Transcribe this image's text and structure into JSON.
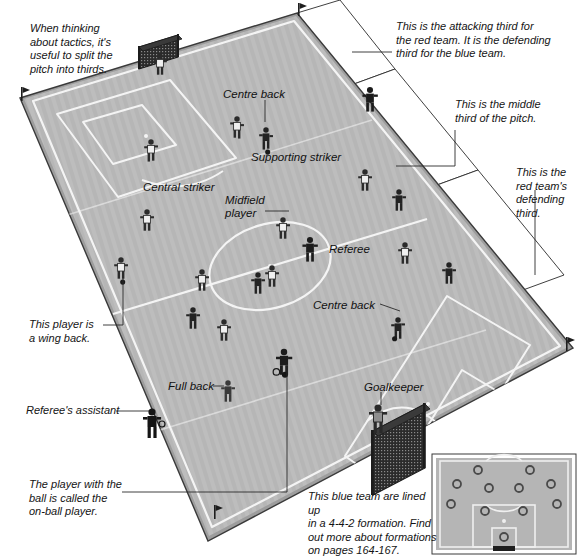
{
  "page": {
    "background": "#ffffff",
    "pitch_fill": "#bdbdbd",
    "line_color": "#f2f2f2",
    "edge_color": "#3a3a3a",
    "leader_color": "#2a2a2a"
  },
  "annotations": {
    "thirds_tip": "When thinking\nabout tactics, it's\nuseful to split the\npitch into thirds.",
    "attacking_third": "This is the attacking third for\nthe red team. It is the defending\nthird for the blue team.",
    "middle_third": "This is the middle\nthird of the pitch.",
    "defending_third": "This is the\nred team's\ndefending\nthird.",
    "wing_back": "This player is\na wing back.",
    "referees_assistant": "Referee's assistant",
    "on_ball_player": "The player with the\nball is called the\non-ball player.",
    "formation_note": "This blue team are lined up\nin a 4-4-2 formation. Find\nout more about formations\non pages 164-167."
  },
  "position_labels": [
    {
      "name": "centre-back-top",
      "text": "Centre back",
      "x": 223,
      "y": 88
    },
    {
      "name": "supporting-striker",
      "text": "Supporting striker",
      "x": 251,
      "y": 151
    },
    {
      "name": "central-striker",
      "text": "Central striker",
      "x": 143,
      "y": 181
    },
    {
      "name": "midfield-player",
      "text": "Midfield\nplayer",
      "x": 225,
      "y": 194
    },
    {
      "name": "referee",
      "text": "Referee",
      "x": 329,
      "y": 243
    },
    {
      "name": "centre-back-bottom",
      "text": "Centre back",
      "x": 313,
      "y": 299
    },
    {
      "name": "full-back",
      "text": "Full back",
      "x": 168,
      "y": 380
    },
    {
      "name": "goalkeeper",
      "text": "Goalkeeper",
      "x": 364,
      "y": 381
    }
  ],
  "pitch": {
    "corners": {
      "top_left": [
        20,
        98
      ],
      "top_right": [
        297,
        13
      ],
      "bottom_right": [
        573,
        348
      ],
      "bottom_left": [
        208,
        541
      ]
    },
    "flags": [
      "top-left",
      "top-right",
      "right",
      "bottom-left"
    ],
    "goals": [
      "top-left-goal",
      "bottom-right-goal"
    ]
  },
  "players": {
    "blue_team_count": 11,
    "red_team_count": 9,
    "officials": [
      "referee",
      "referees-assistant"
    ]
  },
  "formation_inset": {
    "title": "4-4-2 formation",
    "formation": "4-4-2",
    "rows": [
      {
        "name": "strikers",
        "count": 2
      },
      {
        "name": "midfield",
        "count": 4
      },
      {
        "name": "defence",
        "count": 4
      },
      {
        "name": "goalkeeper",
        "count": 1
      }
    ],
    "markers": [
      {
        "x": 0.33,
        "y": 0.1
      },
      {
        "x": 0.67,
        "y": 0.1
      },
      {
        "x": 0.13,
        "y": 0.27
      },
      {
        "x": 0.38,
        "y": 0.32
      },
      {
        "x": 0.62,
        "y": 0.32
      },
      {
        "x": 0.87,
        "y": 0.27
      },
      {
        "x": 0.08,
        "y": 0.5
      },
      {
        "x": 0.35,
        "y": 0.58
      },
      {
        "x": 0.65,
        "y": 0.58
      },
      {
        "x": 0.92,
        "y": 0.5
      },
      {
        "x": 0.5,
        "y": 0.85
      }
    ]
  },
  "chart_data": {
    "type": "diagram",
    "labels": [
      "Centre back",
      "Supporting striker",
      "Central striker",
      "Midfield player",
      "Referee",
      "Centre back",
      "Full back",
      "Goalkeeper"
    ]
  }
}
